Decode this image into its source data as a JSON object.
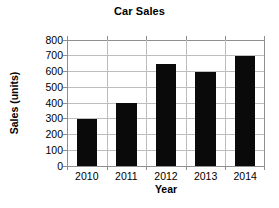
{
  "chart_data": {
    "type": "bar",
    "title": "Car Sales",
    "xlabel": "Year",
    "ylabel": "Sales (units)",
    "categories": [
      "2010",
      "2011",
      "2012",
      "2013",
      "2014"
    ],
    "values": [
      300,
      400,
      650,
      600,
      700
    ],
    "series": [
      {
        "name": "Sales (units)",
        "values": [
          300,
          400,
          650,
          600,
          700
        ]
      }
    ],
    "ylim": [
      0,
      800
    ],
    "ytick_labels": [
      "800",
      "700",
      "600",
      "500",
      "400",
      "300",
      "200",
      "100",
      "0"
    ],
    "ytick_values": [
      800,
      700,
      600,
      500,
      400,
      300,
      200,
      100,
      0
    ],
    "ytick_step": 100,
    "xtick_labels": [
      "2010",
      "2011",
      "2012",
      "2013",
      "2014"
    ],
    "grid": true,
    "grid_axis": "both",
    "legend": false,
    "legend_position": "none",
    "bar_color": "#0a0a0a",
    "grid_color": "#bdbdbd",
    "axis_color": "#8f8f8f",
    "background_color": "#ffffff",
    "text_color": "#000000"
  }
}
